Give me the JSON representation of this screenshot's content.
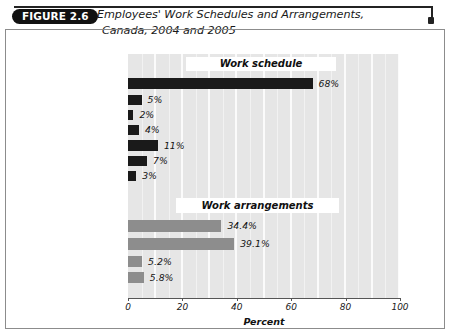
{
  "figure": {
    "badge": "FIGURE 2.6",
    "title_line1": "Employees' Work Schedules and Arrangements,",
    "title_line2": "Canada, 2004 and 2005"
  },
  "sections": {
    "work_schedule_label": "Work schedule",
    "work_arrangements_label": "Work arrangements"
  },
  "chart_data": {
    "type": "bar",
    "orientation": "horizontal",
    "title": "Employees' Work Schedules and Arrangements, Canada, 2004 and 2005",
    "xlabel": "Percent",
    "ylabel": "",
    "xlim": [
      0,
      100
    ],
    "xticks": [
      0,
      20,
      40,
      60,
      80,
      100
    ],
    "xtick_labels": [
      "0",
      "20",
      "40",
      "60",
      "80",
      "100"
    ],
    "grid": true,
    "legend": false,
    "groups": [
      {
        "name": "Work schedule",
        "color": "#1a1a1a",
        "categories": [
          "Regular day schedule",
          "Regular evening schedule",
          "Regular night schedule",
          "On-call or casual",
          "Irregular schedule",
          "Rotating shift",
          "Other schedule"
        ],
        "values": [
          68,
          5,
          2,
          4,
          11,
          7,
          3
        ],
        "data_labels": [
          "68%",
          "5%",
          "2%",
          "4%",
          "11%",
          "7%",
          "3%"
        ]
      },
      {
        "name": "Work arrangements",
        "color": "#8d8d8d",
        "categories": [
          "Flextime – women",
          "Flextime – men",
          "Telework – women",
          "Telework – men"
        ],
        "values": [
          34.4,
          39.1,
          5.2,
          5.8
        ],
        "data_labels": [
          "34.4%",
          "39.1%",
          "5.2%",
          "5.8%"
        ]
      }
    ]
  },
  "rows": [
    {
      "label": "Regular day schedule",
      "value_text": "68%",
      "width": 184.5,
      "top": 78,
      "height": 11,
      "group": "dark"
    },
    {
      "label": "Regular evening schedule",
      "value_text": "5%",
      "width": 13.6,
      "top": 95,
      "height": 10,
      "group": "dark"
    },
    {
      "label": "Regular night schedule",
      "value_text": "2%",
      "width": 5.4,
      "top": 110,
      "height": 10,
      "group": "dark"
    },
    {
      "label": "On-call or casual",
      "value_text": "4%",
      "width": 10.9,
      "top": 125,
      "height": 10,
      "group": "dark"
    },
    {
      "label": "Irregular schedule",
      "value_text": "11%",
      "width": 29.9,
      "top": 140,
      "height": 11,
      "group": "dark"
    },
    {
      "label": "Rotating shift",
      "value_text": "7%",
      "width": 19.0,
      "top": 156,
      "height": 10,
      "group": "dark"
    },
    {
      "label": "Other schedule",
      "value_text": "3%",
      "width": 8.2,
      "top": 171,
      "height": 10,
      "group": "dark"
    },
    {
      "label": "Flextime – women",
      "value_text": "34.4%",
      "width": 93.4,
      "top": 220,
      "height": 12,
      "group": "gray"
    },
    {
      "label": "Flextime – men",
      "value_text": "39.1%",
      "width": 106.2,
      "top": 238,
      "height": 12,
      "group": "gray"
    },
    {
      "label": "Telework – women",
      "value_text": "5.2%",
      "width": 14.1,
      "top": 256,
      "height": 11,
      "group": "gray"
    },
    {
      "label": "Telework – men",
      "value_text": "5.8%",
      "width": 15.8,
      "top": 272,
      "height": 11,
      "group": "gray"
    }
  ],
  "axis": {
    "ticks": [
      {
        "label": "0",
        "x": 128
      },
      {
        "label": "20",
        "x": 182.4
      },
      {
        "label": "40",
        "x": 236.8
      },
      {
        "label": "60",
        "x": 291.2
      },
      {
        "label": "80",
        "x": 345.6
      },
      {
        "label": "100",
        "x": 400
      }
    ],
    "title": "Percent"
  }
}
